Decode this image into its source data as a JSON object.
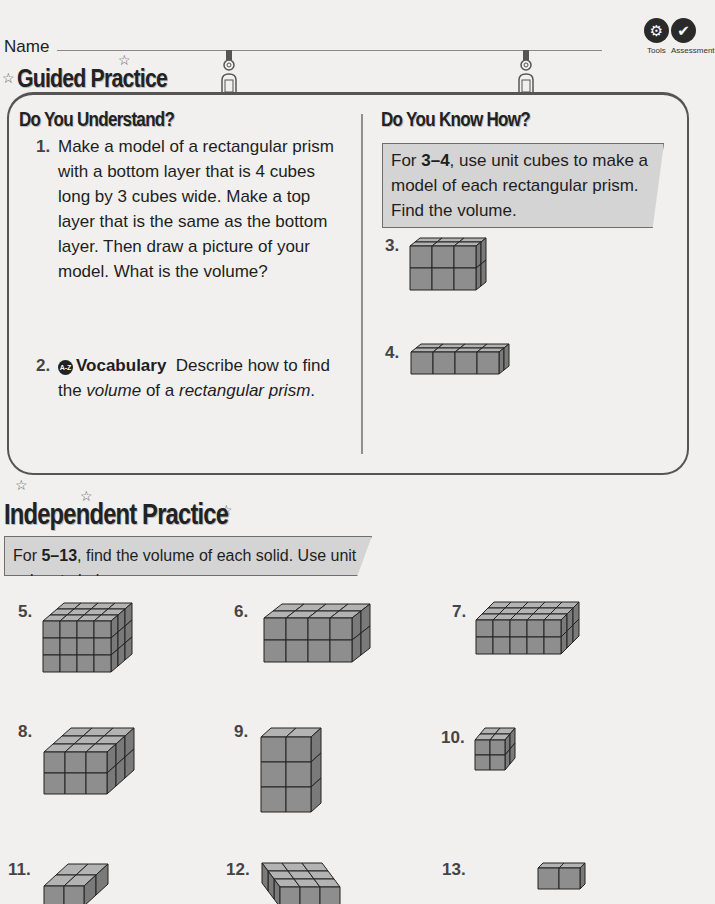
{
  "header": {
    "name_label": "Name",
    "icons": [
      {
        "icon": "tools-icon",
        "label": "Tools"
      },
      {
        "icon": "assessment-icon",
        "label": "Assessment"
      }
    ]
  },
  "guided_practice": {
    "title": "Guided Practice",
    "do_you_understand": {
      "title": "Do You Understand?",
      "questions": [
        {
          "number": "1.",
          "text": "Make a model of a rectangular prism with a bottom layer that is 4 cubes long by 3 cubes wide. Make a top layer that is the same as the bottom layer. Then draw a picture of your model. What is the volume?"
        },
        {
          "number": "2.",
          "badge": "A-Z",
          "bold_lead": "Vocabulary",
          "text_before": "Describe how to find the ",
          "italic1": "volume",
          "text_mid": " of a ",
          "italic2": "rectangular prism",
          "text_after": "."
        }
      ]
    },
    "do_you_know_how": {
      "title": "Do You Know How?",
      "instruction_prefix": "For ",
      "instruction_range": "3–4",
      "instruction_suffix": ", use unit cubes to make a model of each rectangular prism. Find the volume.",
      "problems": [
        {
          "number": "3.",
          "length": 3,
          "width": 2,
          "height": 2
        },
        {
          "number": "4.",
          "length": 4,
          "width": 2,
          "height": 1
        }
      ]
    }
  },
  "independent_practice": {
    "title": "Independent Practice",
    "instruction_prefix": "For ",
    "instruction_range": "5–13",
    "instruction_suffix": ", find the volume of each solid. Use unit cubes to help.",
    "problems": [
      {
        "number": "5.",
        "length": 4,
        "width": 3,
        "height": 3
      },
      {
        "number": "6.",
        "length": 4,
        "width": 2,
        "height": 2
      },
      {
        "number": "7.",
        "length": 5,
        "width": 3,
        "height": 2
      },
      {
        "number": "8.",
        "length": 3,
        "width": 3,
        "height": 2
      },
      {
        "number": "9.",
        "length": 2,
        "width": 1,
        "height": 3
      },
      {
        "number": "10.",
        "length": 2,
        "width": 2,
        "height": 2
      },
      {
        "number": "11.",
        "length": 2,
        "width": 2,
        "height": 1
      },
      {
        "number": "12.",
        "length": 3,
        "width": 3,
        "height": 1
      },
      {
        "number": "13.",
        "length": 2,
        "width": 1,
        "height": 1
      }
    ]
  },
  "colors": {
    "cube_front": "#8e8e8e",
    "cube_top": "#b3b3b3",
    "cube_side": "#7a7a7a",
    "cube_edge": "#222222",
    "instruction_box": "#d4d4d4"
  }
}
